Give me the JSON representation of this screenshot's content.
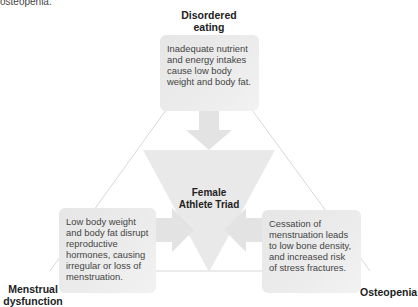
{
  "caption": "osteopenia.",
  "diagram": {
    "center": {
      "line1": "Female",
      "line2": "Athlete Triad"
    },
    "nodes": [
      {
        "id": "disordered-eating",
        "label_line1": "Disordered",
        "label_line2": "eating",
        "description": "Inadequate nutrient and energy intakes cause low body weight and body fat."
      },
      {
        "id": "menstrual-dysfunction",
        "label_line1": "Menstrual",
        "label_line2": "dysfunction",
        "description": "Low body weight and body fat disrupt reproductive hormones, causing irregular or loss of menstruation."
      },
      {
        "id": "osteopenia",
        "label_line1": "Osteopenia",
        "label_line2": "",
        "description": "Cessation of menstruation leads to low bone density, and increased risk of stress fractures."
      }
    ],
    "colors": {
      "box_fill": "#ebebeb",
      "triangle_fill": "#e9e9e9",
      "arrow_fill": "#e4e4e4",
      "line": "#d9d9d9"
    }
  }
}
